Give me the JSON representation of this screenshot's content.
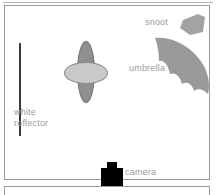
{
  "diagram": {
    "type": "photography-lighting-setup",
    "labels": {
      "reflector": "white\nreflector",
      "snoot": "snoot",
      "umbrella": "umbrella",
      "camera": "camera"
    },
    "elements": [
      {
        "name": "white-reflector",
        "shape": "vertical-bar",
        "color": "#3a3a3a"
      },
      {
        "name": "subject",
        "shape": "two-ellipses",
        "body_color": "#8f8f8f",
        "head_color": "#c9c9c9"
      },
      {
        "name": "snoot",
        "shape": "quadrilateral",
        "color": "#a0a0a0"
      },
      {
        "name": "umbrella",
        "shape": "scalloped-arc",
        "color": "#9a9a9a"
      },
      {
        "name": "camera",
        "shape": "camera-body-with-lens",
        "color": "#000000"
      }
    ],
    "colors": {
      "label_text": "#9b9b9b",
      "border": "#9a9a9a",
      "background": "#ffffff"
    }
  }
}
